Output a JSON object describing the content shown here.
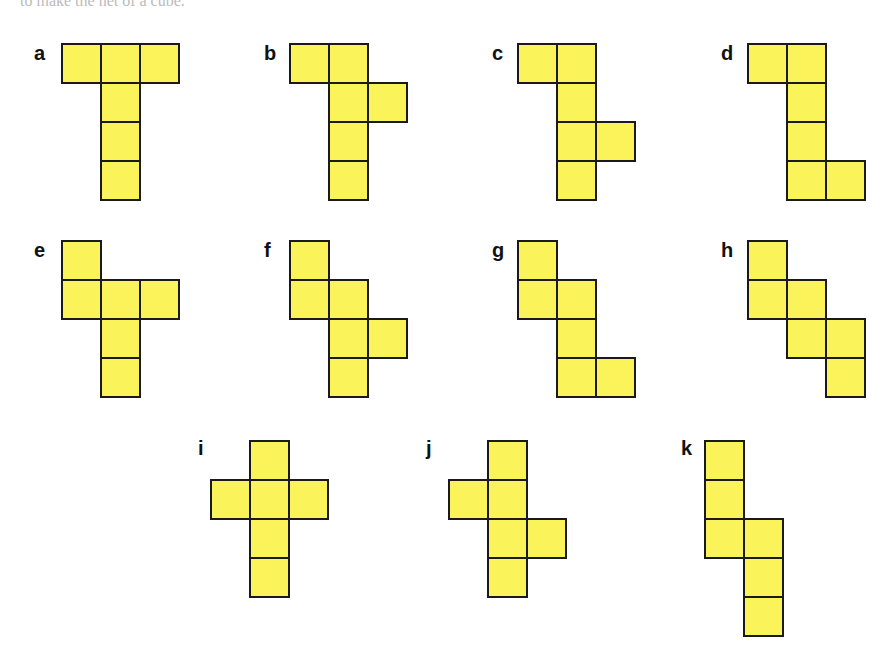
{
  "header": {
    "text": "to make the net of a cube."
  },
  "cell_size": 39,
  "nets": [
    {
      "label": "a",
      "x": 62,
      "y": 44,
      "lx": 34,
      "ly": 42,
      "cells": [
        [
          0,
          0
        ],
        [
          1,
          0
        ],
        [
          2,
          0
        ],
        [
          1,
          1
        ],
        [
          1,
          2
        ],
        [
          1,
          3
        ]
      ]
    },
    {
      "label": "b",
      "x": 290,
      "y": 44,
      "lx": 264,
      "ly": 42,
      "cells": [
        [
          0,
          0
        ],
        [
          1,
          0
        ],
        [
          1,
          1
        ],
        [
          2,
          1
        ],
        [
          1,
          2
        ],
        [
          1,
          3
        ]
      ]
    },
    {
      "label": "c",
      "x": 518,
      "y": 44,
      "lx": 492,
      "ly": 42,
      "cells": [
        [
          0,
          0
        ],
        [
          1,
          0
        ],
        [
          1,
          1
        ],
        [
          1,
          2
        ],
        [
          2,
          2
        ],
        [
          1,
          3
        ]
      ]
    },
    {
      "label": "d",
      "x": 748,
      "y": 44,
      "lx": 721,
      "ly": 42,
      "cells": [
        [
          0,
          0
        ],
        [
          1,
          0
        ],
        [
          1,
          1
        ],
        [
          1,
          2
        ],
        [
          1,
          3
        ],
        [
          2,
          3
        ]
      ]
    },
    {
      "label": "e",
      "x": 62,
      "y": 241,
      "lx": 34,
      "ly": 239,
      "cells": [
        [
          0,
          0
        ],
        [
          0,
          1
        ],
        [
          1,
          1
        ],
        [
          2,
          1
        ],
        [
          1,
          2
        ],
        [
          1,
          3
        ]
      ]
    },
    {
      "label": "f",
      "x": 290,
      "y": 241,
      "lx": 264,
      "ly": 239,
      "cells": [
        [
          0,
          0
        ],
        [
          0,
          1
        ],
        [
          1,
          1
        ],
        [
          1,
          2
        ],
        [
          2,
          2
        ],
        [
          1,
          3
        ]
      ]
    },
    {
      "label": "g",
      "x": 518,
      "y": 241,
      "lx": 492,
      "ly": 239,
      "cells": [
        [
          0,
          0
        ],
        [
          0,
          1
        ],
        [
          1,
          1
        ],
        [
          1,
          2
        ],
        [
          1,
          3
        ],
        [
          2,
          3
        ]
      ]
    },
    {
      "label": "h",
      "x": 748,
      "y": 241,
      "lx": 721,
      "ly": 239,
      "cells": [
        [
          0,
          0
        ],
        [
          0,
          1
        ],
        [
          1,
          1
        ],
        [
          1,
          2
        ],
        [
          2,
          2
        ],
        [
          2,
          3
        ]
      ]
    },
    {
      "label": "i",
      "x": 211,
      "y": 441,
      "lx": 198,
      "ly": 437,
      "cells": [
        [
          1,
          0
        ],
        [
          0,
          1
        ],
        [
          1,
          1
        ],
        [
          2,
          1
        ],
        [
          1,
          2
        ],
        [
          1,
          3
        ]
      ]
    },
    {
      "label": "j",
      "x": 449,
      "y": 441,
      "lx": 426,
      "ly": 437,
      "cells": [
        [
          1,
          0
        ],
        [
          0,
          1
        ],
        [
          1,
          1
        ],
        [
          1,
          2
        ],
        [
          2,
          2
        ],
        [
          1,
          3
        ]
      ]
    },
    {
      "label": "k",
      "x": 705,
      "y": 441,
      "lx": 681,
      "ly": 437,
      "cells": [
        [
          0,
          0
        ],
        [
          0,
          1
        ],
        [
          0,
          2
        ],
        [
          1,
          2
        ],
        [
          1,
          3
        ],
        [
          1,
          4
        ]
      ]
    }
  ]
}
